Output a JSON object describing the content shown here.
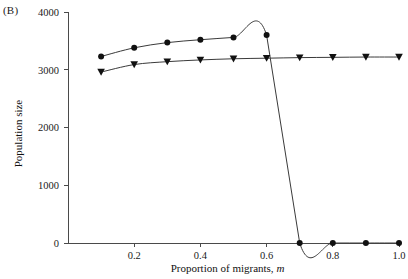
{
  "panel": {
    "label": "(B)"
  },
  "chart_data": {
    "type": "line",
    "title": "",
    "xlabel_main": "Proportion of migrants, ",
    "xlabel_italic": "m",
    "ylabel": "Population size",
    "xlim": [
      0.0,
      1.0
    ],
    "ylim": [
      0,
      4000
    ],
    "xticks": [
      0.2,
      0.4,
      0.6,
      0.8,
      1.0
    ],
    "xticklabels": [
      "0.2",
      "0.4",
      "0.6",
      "0.8",
      "1.0"
    ],
    "yticks": [
      0,
      1000,
      2000,
      3000,
      4000
    ],
    "yticklabels": [
      "0",
      "1000",
      "2000",
      "3000",
      "4000"
    ],
    "grid": false,
    "legend": "none",
    "x": [
      0.1,
      0.2,
      0.3,
      0.4,
      0.5,
      0.6,
      0.7,
      0.8,
      0.9,
      1.0
    ],
    "series": [
      {
        "name": "circle-series",
        "marker": "circle",
        "color": "#111111",
        "values": [
          3230,
          3380,
          3470,
          3520,
          3560,
          3600,
          0,
          0,
          0,
          0
        ]
      },
      {
        "name": "triangle-series",
        "marker": "triangle-down",
        "color": "#111111",
        "values": [
          2960,
          3090,
          3140,
          3170,
          3190,
          3200,
          3210,
          3215,
          3220,
          3220
        ]
      }
    ]
  },
  "layout": {
    "plot_left": 68,
    "plot_right": 399,
    "plot_top": 12,
    "plot_bottom": 243,
    "axis_color": "#4a4a4a",
    "line_color": "#3a3a3a",
    "marker_color": "#111111",
    "background": "#ffffff"
  }
}
